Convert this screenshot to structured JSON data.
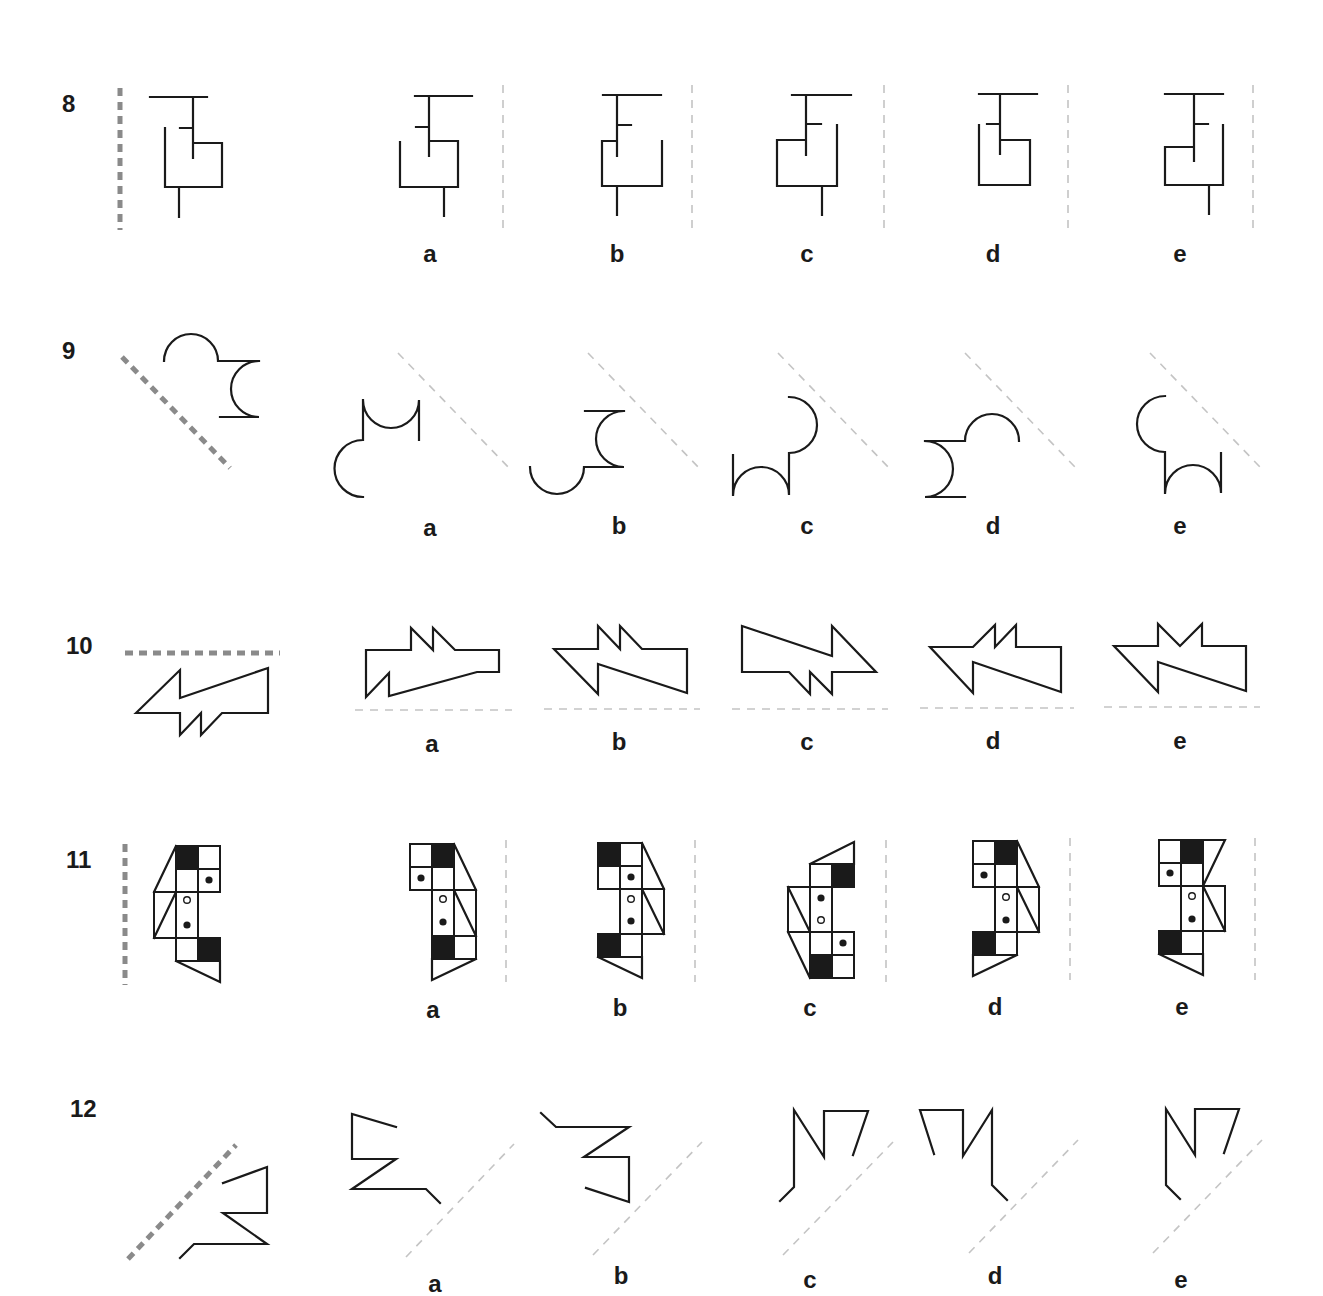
{
  "colors": {
    "ink": "#1a1a1a",
    "question_mirror": "#8a8a8a",
    "option_mirror": "#c4c4c4"
  },
  "questions": [
    {
      "number": "8",
      "mirror_orientation": "vertical",
      "options": [
        "a",
        "b",
        "c",
        "d",
        "e"
      ]
    },
    {
      "number": "9",
      "mirror_orientation": "diagonal-down",
      "options": [
        "a",
        "b",
        "c",
        "d",
        "e"
      ]
    },
    {
      "number": "10",
      "mirror_orientation": "horizontal",
      "options": [
        "a",
        "b",
        "c",
        "d",
        "e"
      ]
    },
    {
      "number": "11",
      "mirror_orientation": "vertical",
      "options": [
        "a",
        "b",
        "c",
        "d",
        "e"
      ]
    },
    {
      "number": "12",
      "mirror_orientation": "diagonal-up",
      "options": [
        "a",
        "b",
        "c",
        "d",
        "e"
      ]
    }
  ]
}
